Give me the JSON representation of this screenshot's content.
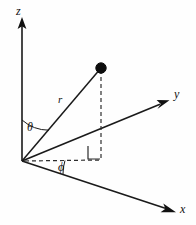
{
  "figure": {
    "kind": "spherical-coordinate-diagram",
    "background_color": "#fefefe",
    "ink_color": "#111111",
    "width": 196,
    "height": 225
  },
  "axes": {
    "z": {
      "label": "z",
      "origin": [
        22,
        161
      ],
      "tip": [
        22,
        18
      ],
      "style": "solid",
      "arrow": true
    },
    "y": {
      "label": "y",
      "origin": [
        22,
        161
      ],
      "tip": [
        168,
        101
      ],
      "style": "solid",
      "arrow": true
    },
    "x": {
      "label": "x",
      "origin": [
        22,
        161
      ],
      "tip": [
        175,
        212
      ],
      "style": "solid",
      "arrow": true
    }
  },
  "point": {
    "label": "",
    "position": [
      101,
      68
    ],
    "radius": 5.2,
    "filled": true
  },
  "segments": {
    "radius_vector": {
      "label": "r",
      "from": [
        22,
        161
      ],
      "to": [
        101,
        68
      ],
      "style": "solid"
    },
    "vertical_drop": {
      "label": "",
      "from": [
        101,
        68
      ],
      "to": [
        101,
        160
      ],
      "style": "dashed"
    },
    "horizontal_projection": {
      "label": "",
      "from": [
        24,
        161
      ],
      "to": [
        101,
        160
      ],
      "style": "dashed"
    },
    "xy_projection_ray": {
      "label": "",
      "from": [
        22,
        161
      ],
      "to": [
        168,
        101
      ],
      "style": "solid"
    }
  },
  "angles": {
    "theta": {
      "label": "θ",
      "description": "polar-angle-from-z-axis",
      "vertex": [
        22,
        161
      ],
      "arc_radius": 41,
      "from_deg": 270,
      "to_deg": 310
    },
    "phi": {
      "label": "ϕ",
      "description": "azimuthal-angle-in-xy-plane",
      "vertex": [
        22,
        161
      ],
      "arc_radius": 43,
      "from_deg": 0,
      "to_deg": 18
    }
  },
  "markers": {
    "right_angle": {
      "label": "",
      "description": "right-angle-between-drop-and-projection",
      "corner": [
        100,
        159
      ],
      "size": 12
    }
  },
  "icons": {
    "z_arrow": "arrow-up-icon",
    "y_arrow": "arrow-up-right-icon",
    "x_arrow": "arrow-down-right-icon",
    "point_marker": "filled-circle-icon",
    "right_angle_marker": "right-angle-icon"
  }
}
